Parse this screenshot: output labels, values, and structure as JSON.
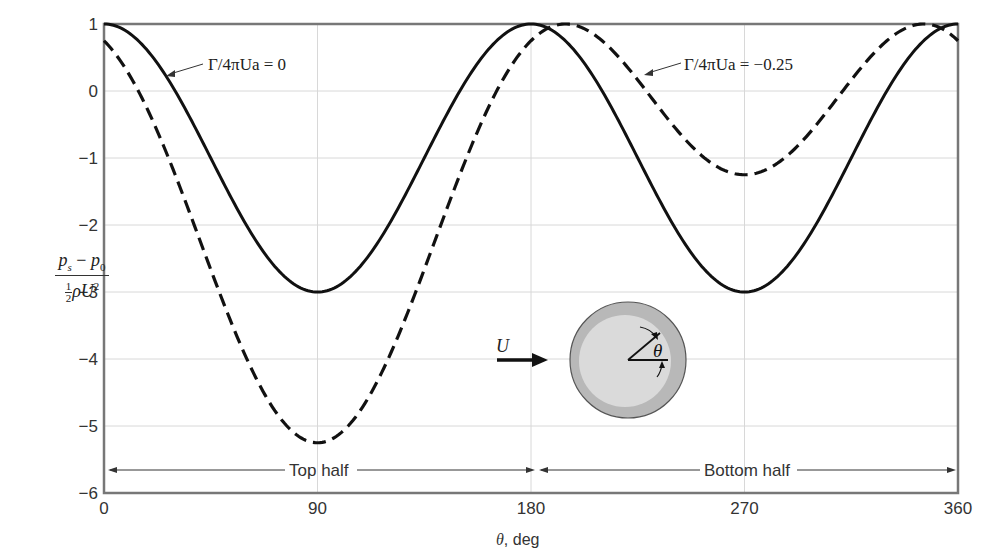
{
  "chart_data": {
    "type": "line",
    "title": "",
    "xlabel": "θ, deg",
    "ylabel": "(p_s − p_0) / (½ ρ U²)",
    "xlim": [
      0,
      360
    ],
    "ylim": [
      -6,
      1
    ],
    "grid": true,
    "x_ticks": [
      0,
      90,
      180,
      270,
      360
    ],
    "y_ticks": [
      1,
      0,
      -1,
      -2,
      -3,
      -4,
      -5,
      -6
    ],
    "x_tick_labels": [
      "0",
      "90",
      "180",
      "270",
      "360"
    ],
    "y_tick_labels": [
      "1",
      "0",
      "−1",
      "−2",
      "−3",
      "−4",
      "−5",
      "−6"
    ],
    "series": [
      {
        "name": "Γ/4πUa = 0",
        "style": "solid",
        "formula": "1 - 4*sin(θ)^2",
        "key_points": {
          "x": [
            0,
            90,
            180,
            270,
            360
          ],
          "y": [
            1,
            -3,
            1,
            -3,
            1
          ]
        }
      },
      {
        "name": "Γ/4πUa = −0.25",
        "style": "dashed",
        "formula": "1 - 4*(sin(θ) + 0.25)^2",
        "key_points": {
          "x": [
            0,
            90,
            180,
            194.5,
            270,
            345.5,
            360
          ],
          "y": [
            0.75,
            -5.25,
            0.75,
            1,
            -1.25,
            1,
            0.75
          ]
        }
      }
    ],
    "annotations": [
      {
        "text": "Γ/4πUa = 0",
        "points_to": "solid curve near θ≈30°"
      },
      {
        "text": "Γ/4πUa = −0.25",
        "points_to": "dashed curve near θ≈225°"
      },
      {
        "text": "Top half",
        "span": [
          0,
          180
        ]
      },
      {
        "text": "Bottom half",
        "span": [
          180,
          360
        ]
      }
    ],
    "legend": "inline annotations"
  },
  "labels": {
    "y_num_main": "p",
    "y_num_sub1": "s",
    "y_num_minus": " − ",
    "y_num_sub0": "0",
    "y_den_half_top": "1",
    "y_den_half_bot": "2",
    "y_den_rest": "ρU",
    "y_den_sup": "2",
    "x_theta": "θ",
    "x_unit": ", deg",
    "ann_solid": "Γ/4πUa = 0",
    "ann_dashed": "Γ/4πUa = −0.25",
    "top_half": "Top half",
    "bottom_half": "Bottom half",
    "inset_velocity": "U",
    "inset_angle": "θ"
  },
  "colors": {
    "curve": "#111111",
    "axis": "#777777",
    "grid": "#d8d8d8",
    "cylinder_outer": "#b8b8b8",
    "cylinder_inner": "#d9d9d9"
  }
}
